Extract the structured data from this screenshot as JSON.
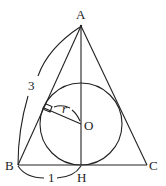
{
  "diagram": {
    "type": "geometry",
    "points": {
      "A": {
        "label": "A",
        "x": 81,
        "y": 26
      },
      "B": {
        "label": "B",
        "x": 18,
        "y": 165
      },
      "C": {
        "label": "C",
        "x": 147,
        "y": 165
      },
      "H": {
        "label": "H",
        "x": 81,
        "y": 165
      },
      "O": {
        "label": "O",
        "x": 81,
        "y": 124
      }
    },
    "incircle": {
      "center": "O",
      "radius_px": 41
    },
    "radius_label": "r",
    "measure_AB": "3",
    "measure_BH": "1",
    "stroke_color": "#222222"
  }
}
